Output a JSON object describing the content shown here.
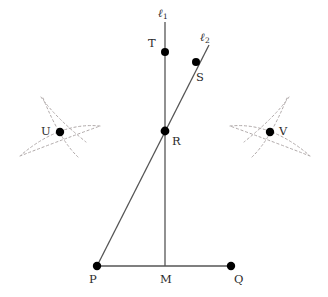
{
  "figure": {
    "type": "geometric-construction",
    "background_color": "#ffffff",
    "stroke_color": "#555555",
    "arc_color": "#b0a9a9",
    "dot_color": "#000000",
    "label_color": "#2b2b2b"
  },
  "points": [
    {
      "id": "T",
      "label": "T",
      "x": 165,
      "y": 52,
      "dot": true,
      "label_x": 148,
      "label_y": 38
    },
    {
      "id": "S",
      "label": "S",
      "x": 196,
      "y": 62,
      "dot": true,
      "label_x": 196,
      "label_y": 72
    },
    {
      "id": "R",
      "label": "R",
      "x": 165,
      "y": 131,
      "dot": true,
      "label_x": 172,
      "label_y": 136
    },
    {
      "id": "U",
      "label": "U",
      "x": 60,
      "y": 132,
      "dot": true,
      "label_x": 41,
      "label_y": 126
    },
    {
      "id": "V",
      "label": "V",
      "x": 270,
      "y": 132,
      "dot": true,
      "label_x": 279,
      "label_y": 126
    },
    {
      "id": "P",
      "label": "P",
      "x": 97,
      "y": 266,
      "dot": true,
      "label_x": 89,
      "label_y": 274
    },
    {
      "id": "M",
      "label": "M",
      "x": 165,
      "y": 266,
      "dot": false,
      "label_x": 160,
      "label_y": 274
    },
    {
      "id": "Q",
      "label": "Q",
      "x": 231,
      "y": 266,
      "dot": true,
      "label_x": 234,
      "label_y": 274
    }
  ],
  "lines": [
    {
      "id": "l1",
      "label": "ℓ",
      "subscript": "1",
      "x1": 165,
      "y1": 22,
      "x2": 165,
      "y2": 266,
      "label_x": 158,
      "label_y": 8
    },
    {
      "id": "l2",
      "label": "ℓ",
      "subscript": "2",
      "x1": 97,
      "y1": 266,
      "x2": 209,
      "y2": 45,
      "label_x": 200,
      "label_y": 32
    },
    {
      "id": "pq",
      "label": "",
      "subscript": "",
      "x1": 97,
      "y1": 266,
      "x2": 231,
      "y2": 266,
      "label_x": 0,
      "label_y": 0
    }
  ],
  "arcs": [
    {
      "id": "u-arc-upper",
      "d": "M 41 97 Q 55 117 86 142"
    },
    {
      "id": "u-arc-right",
      "d": "M 20 156 Q 56 142 100 126"
    },
    {
      "id": "u-arc-lower",
      "d": "M 78 157 Q 60 140 43 98"
    },
    {
      "id": "u-arc-left",
      "d": "M 100 126 Q 60 122 21 155"
    },
    {
      "id": "v-arc-upper",
      "d": "M 289 97 Q 275 117 244 142"
    },
    {
      "id": "v-arc-left",
      "d": "M 310 156 Q 274 142 230 126"
    },
    {
      "id": "v-arc-lower",
      "d": "M 252 157 Q 270 140 287 98"
    },
    {
      "id": "v-arc-right",
      "d": "M 230 126 Q 270 122 309 155"
    }
  ]
}
